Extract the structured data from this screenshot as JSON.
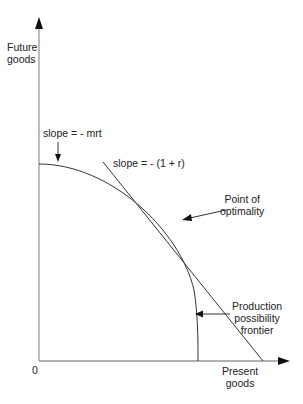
{
  "diagram": {
    "y_axis_label": [
      "Future",
      "goods"
    ],
    "x_axis_label": [
      "Present",
      "goods"
    ],
    "origin_label": "0",
    "annotations": {
      "mrt_slope": "slope =  - mrt",
      "tangent_slope": "slope =  - (1 + r)",
      "optimum": [
        "Point of",
        "optimality"
      ],
      "frontier": [
        "Production",
        "possibility",
        "frontier"
      ]
    },
    "colors": {
      "axis": "#999999",
      "curve": "#333333",
      "text": "#222222"
    }
  }
}
